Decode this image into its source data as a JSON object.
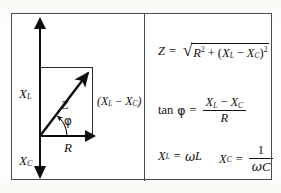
{
  "figure": {
    "type": "ac-impedance-phasor-diagram",
    "panels": {
      "left": "phasor vector diagram",
      "right": "impedance formulas"
    }
  },
  "diagram": {
    "labels": {
      "inductive_reactance": "X",
      "inductive_reactance_sub": "L",
      "capacitive_reactance": "X",
      "capacitive_reactance_sub": "C",
      "impedance": "Z",
      "resistance": "R",
      "phase_angle": "φ",
      "reactance_difference_open": "(",
      "reactance_difference": "X",
      "reactance_difference_sub_1": "L",
      "reactance_difference_minus": "−",
      "reactance_difference_2": "X",
      "reactance_difference_sub_2": "C",
      "reactance_difference_close": ")"
    },
    "vectors": {
      "x_l_direction": "up",
      "x_c_direction": "down",
      "r_direction": "right",
      "z_direction": "diagonal-up-right"
    }
  },
  "formulas": {
    "impedance": {
      "lhs": "Z",
      "equals": "=",
      "radical_sign": "√",
      "term_r": "R",
      "term_r_exp": "2",
      "plus": "+",
      "group_open": "(",
      "term_xl": "X",
      "term_xl_sub": "L",
      "minus": "−",
      "term_xc": "X",
      "term_xc_sub": "C",
      "group_close": ")",
      "group_exp": "2"
    },
    "tangent": {
      "tan": "tan",
      "phi": "φ",
      "equals": "=",
      "numerator_xl": "X",
      "numerator_xl_sub": "L",
      "minus": "−",
      "numerator_xc": "X",
      "numerator_xc_sub": "C",
      "denominator": "R"
    },
    "inductive_reactance": {
      "lhs": "X",
      "lhs_sub": "L",
      "equals": "=",
      "omega": "ω",
      "inductance": "L"
    },
    "capacitive_reactance": {
      "lhs": "X",
      "lhs_sub": "C",
      "equals": "=",
      "numerator": "1",
      "denominator_omega": "ω",
      "denominator_capacitance": "C"
    }
  },
  "colors": {
    "ink": "#0d0d0d",
    "frame": "#4a4a4a",
    "construction_line": "#2a2a2a",
    "background": "#fdfdfc"
  }
}
